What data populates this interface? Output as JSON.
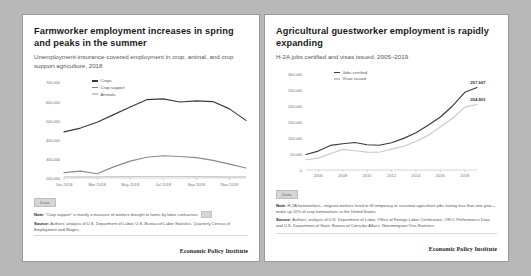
{
  "theme": {
    "page_background": "#b8b8b8",
    "panel_background": "#ffffff",
    "panel_border": "#9a9a9a",
    "series_dark": "#3a3a3a",
    "series_mid": "#8a8a8a",
    "series_light": "#c9c9c9",
    "axis_color": "#bbbbbb",
    "text_color": "#555555"
  },
  "left_panel": {
    "title": "Farmworker employment increases in spring and peaks in the summer",
    "subtitle": "Unemployment-insurance-covered employment in crop, animal, and crop support agriculture, 2018",
    "data_button": "Data",
    "note_label": "Note:",
    "note_text": "“Crop support” is mostly a measure of workers brought to farms by labor contractors.",
    "source_label": "Source:",
    "source_text": "Authors' analysis of U.S. Department of Labor, U.S. Bureau of Labor Statistics, Quarterly Census of Employment and Wages.",
    "footer": "Economic Policy Institute"
  },
  "right_panel": {
    "title": "Agricultural guestworker employment is rapidly expanding",
    "subtitle": "H-2A jobs certified and visas issued, 2005–2019",
    "data_button": "Data",
    "note_label": "Note:",
    "note_text": "H-2A farmworkers—migrant workers hired to fill temporary or seasonal agriculture jobs lasting less than one year—make up 10% of crop farmworkers in the United States.",
    "source_label": "Source:",
    "source_text": "Authors' analysis of U.S. Department of Labor, Office of Foreign Labor Certification, OFLC Performance Data, and U.S. Department of State, Bureau of Consular Affairs, Nonimmigrant Visa Statistics.",
    "footer": "Economic Policy Institute"
  },
  "chart_data": [
    {
      "type": "line",
      "id": "farmworker-employment",
      "title": "Farmworker employment increases in spring and peaks in the summer",
      "subtitle": "Unemployment-insurance-covered employment in crop, animal, and crop support agriculture, 2018",
      "xlabel": "",
      "ylabel": "",
      "grid": false,
      "legend_position": "top-left",
      "categories": [
        "Jan 2018",
        "Feb 2018",
        "Mar 2018",
        "Apr 2018",
        "May 2018",
        "Jun 2018",
        "Jul 2018",
        "Aug 2018",
        "Sep 2018",
        "Oct 2018",
        "Nov 2018",
        "Dec 2018"
      ],
      "xticks": [
        "Jan 2018",
        "Mar 2018",
        "May 2018",
        "Jul 2018",
        "Sep 2018",
        "Nov 2018"
      ],
      "yticks": [
        "700,000",
        "600,000",
        "500,000",
        "400,000",
        "300,000",
        "200,000"
      ],
      "ylim": [
        200000,
        700000
      ],
      "series": [
        {
          "name": "Crops",
          "color": "#3a3a3a",
          "values": [
            440000,
            460000,
            490000,
            530000,
            570000,
            608000,
            612000,
            596000,
            602000,
            598000,
            560000,
            500000
          ]
        },
        {
          "name": "Crop support",
          "color": "#8a8a8a",
          "values": [
            228000,
            236000,
            222000,
            258000,
            288000,
            308000,
            316000,
            312000,
            306000,
            292000,
            272000,
            252000
          ]
        },
        {
          "name": "Animals",
          "color": "#c9c9c9",
          "values": [
            206000,
            206000,
            206000,
            207000,
            207000,
            208000,
            208000,
            208000,
            207000,
            207000,
            206000,
            206000
          ]
        }
      ]
    },
    {
      "type": "line",
      "id": "h2a-guestworkers",
      "title": "Agricultural guestworker employment is rapidly expanding",
      "subtitle": "H-2A jobs certified and visas issued, 2005–2019",
      "xlabel": "",
      "ylabel": "",
      "grid": false,
      "legend_position": "top-left",
      "categories": [
        "2005",
        "2006",
        "2007",
        "2008",
        "2009",
        "2010",
        "2011",
        "2012",
        "2013",
        "2014",
        "2015",
        "2016",
        "2017",
        "2018",
        "2019"
      ],
      "xticks": [
        "2006",
        "2008",
        "2010",
        "2012",
        "2014",
        "2016",
        "2018"
      ],
      "yticks": [
        "300,000",
        "250,000",
        "200,000",
        "150,000",
        "100,000",
        "50,000",
        "0"
      ],
      "ylim": [
        0,
        300000
      ],
      "end_labels": [
        "257,667",
        "204,801"
      ],
      "series": [
        {
          "name": "Jobs certified",
          "color": "#3a3a3a",
          "values": [
            48336,
            59112,
            76814,
            82099,
            86014,
            79011,
            77246,
            85248,
            98821,
            116689,
            139832,
            165741,
            200049,
            242762,
            257667
          ]
        },
        {
          "name": "Visas issued",
          "color": "#c9c9c9",
          "values": [
            31892,
            37149,
            50791,
            64404,
            60112,
            55921,
            55384,
            65345,
            74192,
            89274,
            108144,
            134368,
            161583,
            196409,
            204801
          ]
        }
      ]
    }
  ]
}
